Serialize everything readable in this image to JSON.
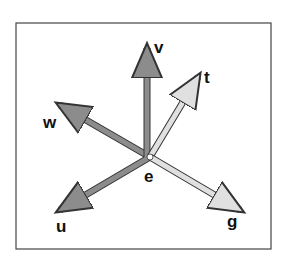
{
  "diagram": {
    "origin": {
      "label": "e",
      "x": 150,
      "y": 157
    },
    "vectors": [
      {
        "name": "v",
        "label": "v",
        "tip": [
          147,
          40
        ],
        "shade": "dark"
      },
      {
        "name": "t",
        "label": "t",
        "tip": [
          202,
          70
        ],
        "shade": "light"
      },
      {
        "name": "w",
        "label": "w",
        "tip": [
          53,
          100
        ],
        "shade": "dark"
      },
      {
        "name": "u",
        "label": "u",
        "tip": [
          52,
          215
        ],
        "shade": "dark"
      },
      {
        "name": "g",
        "label": "g",
        "tip": [
          247,
          215
        ],
        "shade": "light"
      }
    ],
    "colors": {
      "dark": "#8c8c8c",
      "light": "#e0e0e0",
      "outline": "#333333",
      "frame": "#444444"
    }
  }
}
